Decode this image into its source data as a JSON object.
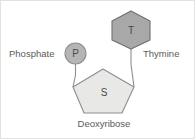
{
  "figure": {
    "background_color": "#ffffff",
    "border_color": "#e2e2e2"
  },
  "shapes": {
    "phosphate": {
      "glyph": "P",
      "shape": "circle",
      "fill_color": "#b5b5b5",
      "stroke_color": "#8d8d8d",
      "cx": 74.5,
      "cy": 52.5,
      "r": 10.5
    },
    "sugar": {
      "glyph": "S",
      "shape": "pentagon",
      "fill_color": "#e8e8e6",
      "stroke_color": "#8d8d8d",
      "cx": 102,
      "cy": 91,
      "label_x": 103,
      "label_y": 92
    },
    "base": {
      "glyph": "T",
      "shape": "hexagon",
      "fill_color": "#a8a8a8",
      "stroke_color": "#6f6f6f",
      "cx": 130,
      "cy": 29,
      "label_x": 130,
      "label_y": 30
    }
  },
  "labels": {
    "phosphate": "Phosphate",
    "thymine": "Thymine",
    "deoxyribose": "Deoxyribose"
  },
  "geometry": {
    "pentagon_points": "102,68 133,86 121,112 83,112 72,86",
    "hexagon_points": "130,10 149,20 149,39 130,48 111,39 111,20",
    "connector_phosphate_to_sugar": "M 74.5,63 L 74.5,74 L 72,86",
    "connector_base_to_sugar": "M 130,48 L 130,63 L 133,86"
  }
}
